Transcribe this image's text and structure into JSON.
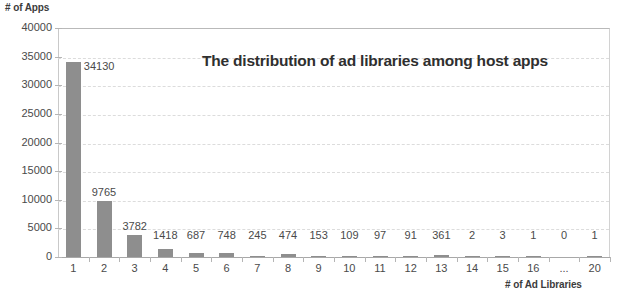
{
  "chart_data": {
    "type": "bar",
    "title": "The distribution of ad libraries among host apps",
    "xlabel": "# of Ad Libraries",
    "ylabel": "# of Apps",
    "categories": [
      "1",
      "2",
      "3",
      "4",
      "5",
      "6",
      "7",
      "8",
      "9",
      "10",
      "11",
      "12",
      "13",
      "14",
      "15",
      "16",
      "...",
      "20"
    ],
    "values": [
      34130,
      9765,
      3782,
      1418,
      687,
      748,
      245,
      474,
      153,
      109,
      97,
      91,
      361,
      2,
      3,
      1,
      0,
      1
    ],
    "data_labels": [
      "34130",
      "9765",
      "3782",
      "1418",
      "687",
      "748",
      "245",
      "474",
      "153",
      "109",
      "97",
      "91",
      "361",
      "2",
      "3",
      "1",
      "0",
      "1"
    ],
    "ylim": [
      0,
      40000
    ],
    "y_ticks": [
      0,
      5000,
      10000,
      15000,
      20000,
      25000,
      30000,
      35000,
      40000
    ],
    "y_tick_labels": [
      "0",
      "5000",
      "10000",
      "15000",
      "20000",
      "25000",
      "30000",
      "35000",
      "40000"
    ],
    "grid": true,
    "grid_style": "dashed-horizontal",
    "legend": null,
    "bar_color": "#8e8e8e",
    "grid_color": "#dcdcdc",
    "axis_color": "#b5b5b5",
    "text_color": "#4a4a4a",
    "title_color": "#2f2f2f"
  }
}
